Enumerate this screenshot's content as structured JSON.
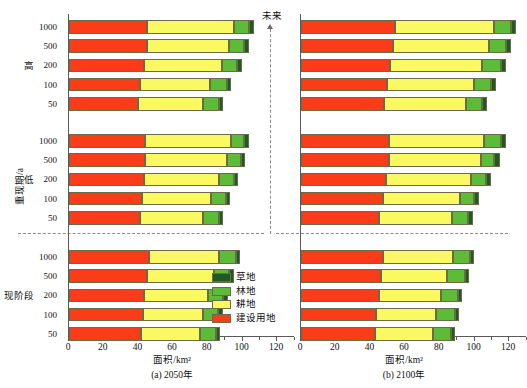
{
  "figure": {
    "ylabel": "重现期/a",
    "future_label": "未来",
    "group_labels": [
      "高",
      "低",
      "现阶段"
    ],
    "legend": [
      {
        "name": "草地",
        "color": "#1d5c20"
      },
      {
        "name": "林地",
        "color": "#5cbc37"
      },
      {
        "name": "耕地",
        "color": "#fbf961"
      },
      {
        "name": "建设用地",
        "color": "#fa3c18"
      }
    ]
  },
  "chart_data": [
    {
      "type": "bar",
      "orientation": "horizontal",
      "stacked": true,
      "title": "(a) 2050年",
      "xlabel": "面积/km²",
      "ylabel": "重现期/a",
      "xlim": [
        0,
        130
      ],
      "xticks": [
        0,
        20,
        40,
        60,
        80,
        100,
        120
      ],
      "xticklabels": [
        "0",
        "20",
        "40",
        "60",
        "80",
        "100",
        "120"
      ],
      "grid": false,
      "legend_position": "lower-right",
      "groups": [
        {
          "name": "高",
          "categories": [
            "1000",
            "500",
            "200",
            "100",
            "50"
          ],
          "series": [
            {
              "name": "建设用地",
              "color": "#fa3c18",
              "values": [
                45.0,
                45.0,
                43.5,
                41.0,
                40.0
              ]
            },
            {
              "name": "耕地",
              "color": "#fbf961",
              "values": [
                50.0,
                47.5,
                44.5,
                40.5,
                37.0
              ]
            },
            {
              "name": "林地",
              "color": "#5cbc37",
              "values": [
                8.5,
                8.5,
                9.0,
                9.5,
                9.5
              ]
            },
            {
              "name": "草地",
              "color": "#1d5c20",
              "values": [
                3.0,
                2.5,
                2.5,
                2.5,
                2.5
              ]
            }
          ],
          "totals": [
            106.5,
            103.5,
            99.5,
            93.5,
            89.0
          ]
        },
        {
          "name": "低",
          "categories": [
            "1000",
            "500",
            "200",
            "100",
            "50"
          ],
          "series": [
            {
              "name": "建设用地",
              "color": "#fa3c18",
              "values": [
                44.0,
                44.0,
                43.5,
                42.0,
                41.0
              ]
            },
            {
              "name": "耕地",
              "color": "#fbf961",
              "values": [
                49.5,
                47.0,
                43.0,
                40.0,
                36.5
              ]
            },
            {
              "name": "林地",
              "color": "#5cbc37",
              "values": [
                7.5,
                8.0,
                8.5,
                8.5,
                9.0
              ]
            },
            {
              "name": "草地",
              "color": "#1d5c20",
              "values": [
                2.5,
                2.5,
                2.5,
                2.5,
                2.5
              ]
            }
          ],
          "totals": [
            103.5,
            101.5,
            97.5,
            93.0,
            89.0
          ]
        },
        {
          "name": "现阶段",
          "categories": [
            "1000",
            "500",
            "200",
            "100",
            "50"
          ],
          "series": [
            {
              "name": "建设用地",
              "color": "#fa3c18",
              "values": [
                46.0,
                45.0,
                43.5,
                42.5,
                41.5
              ]
            },
            {
              "name": "耕地",
              "color": "#fbf961",
              "values": [
                40.5,
                38.5,
                36.5,
                34.5,
                34.0
              ]
            },
            {
              "name": "林地",
              "color": "#5cbc37",
              "values": [
                9.5,
                9.0,
                9.0,
                9.0,
                9.0
              ]
            },
            {
              "name": "草地",
              "color": "#1d5c20",
              "values": [
                2.5,
                2.5,
                2.5,
                2.5,
                2.5
              ]
            }
          ],
          "totals": [
            98.5,
            95.0,
            91.5,
            88.5,
            87.0
          ]
        }
      ]
    },
    {
      "type": "bar",
      "orientation": "horizontal",
      "stacked": true,
      "title": "(b) 2100年",
      "xlabel": "面积/km²",
      "ylabel": "重现期/a",
      "xlim": [
        0,
        130
      ],
      "xticks": [
        0,
        20,
        40,
        60,
        80,
        100,
        120
      ],
      "xticklabels": [
        "0",
        "20",
        "40",
        "60",
        "80",
        "100",
        "120"
      ],
      "grid": false,
      "legend_position": "none",
      "groups": [
        {
          "name": "高",
          "categories": [
            "1000",
            "500",
            "200",
            "100",
            "50"
          ],
          "series": [
            {
              "name": "建设用地",
              "color": "#fa3c18",
              "values": [
                54.0,
                53.0,
                51.5,
                49.5,
                48.0
              ]
            },
            {
              "name": "耕地",
              "color": "#fbf961",
              "values": [
                57.0,
                55.5,
                53.0,
                50.0,
                47.0
              ]
            },
            {
              "name": "林地",
              "color": "#5cbc37",
              "values": [
                10.0,
                9.5,
                10.5,
                10.0,
                9.5
              ]
            },
            {
              "name": "草地",
              "color": "#1d5c20",
              "values": [
                3.0,
                3.0,
                3.0,
                3.0,
                3.0
              ]
            }
          ],
          "totals": [
            124.0,
            121.0,
            118.0,
            112.5,
            107.5
          ]
        },
        {
          "name": "低",
          "categories": [
            "1000",
            "500",
            "200",
            "100",
            "50"
          ],
          "series": [
            {
              "name": "建设用地",
              "color": "#fa3c18",
              "values": [
                51.0,
                50.5,
                49.0,
                47.0,
                45.0
              ]
            },
            {
              "name": "耕地",
              "color": "#fbf961",
              "values": [
                54.5,
                53.0,
                49.0,
                44.5,
                42.0
              ]
            },
            {
              "name": "林地",
              "color": "#5cbc37",
              "values": [
                9.5,
                8.0,
                8.5,
                8.0,
                9.0
              ]
            },
            {
              "name": "草地",
              "color": "#1d5c20",
              "values": [
                3.0,
                3.0,
                3.0,
                3.0,
                3.0
              ]
            }
          ],
          "totals": [
            118.0,
            114.5,
            109.5,
            102.5,
            99.0
          ]
        },
        {
          "name": "现阶段",
          "categories": [
            "1000",
            "500",
            "200",
            "100",
            "50"
          ],
          "series": [
            {
              "name": "建设用地",
              "color": "#fa3c18",
              "values": [
                47.0,
                46.0,
                45.0,
                43.5,
                42.5
              ]
            },
            {
              "name": "耕地",
              "color": "#fbf961",
              "values": [
                40.5,
                38.0,
                35.5,
                34.5,
                33.5
              ]
            },
            {
              "name": "林地",
              "color": "#5cbc37",
              "values": [
                10.0,
                10.5,
                10.0,
                10.5,
                10.5
              ]
            },
            {
              "name": "草地",
              "color": "#1d5c20",
              "values": [
                2.5,
                2.5,
                2.5,
                2.5,
                2.5
              ]
            }
          ],
          "totals": [
            100.0,
            97.0,
            93.0,
            91.0,
            89.0
          ]
        }
      ]
    }
  ]
}
